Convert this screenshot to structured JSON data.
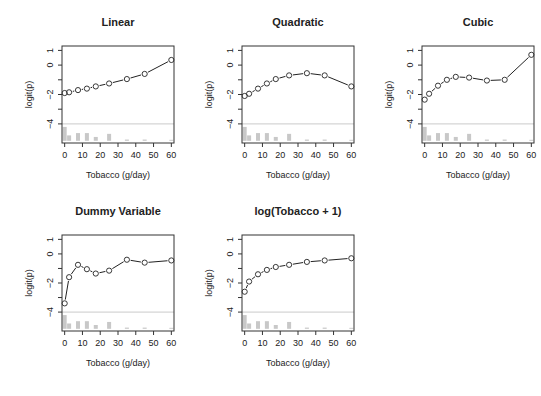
{
  "figure": {
    "panels_layout": "2 rows x 3 columns, last cell empty"
  },
  "chart_data": [
    {
      "type": "line",
      "title": "Linear",
      "xlabel": "Tobacco (g/day)",
      "ylabel": "logit(p)",
      "x": [
        0,
        2.5,
        7.5,
        12.5,
        17.5,
        25,
        35,
        45,
        60
      ],
      "values": [
        -1.9,
        -1.85,
        -1.7,
        -1.6,
        -1.45,
        -1.25,
        -0.95,
        -0.6,
        0.35
      ],
      "xticks": [
        0,
        10,
        20,
        30,
        40,
        50,
        60
      ],
      "yticks": [
        1,
        0,
        -1,
        -2,
        -3,
        -4
      ],
      "ytick_labels": [
        "1",
        "0",
        "",
        "-2",
        "",
        "-4"
      ],
      "xlim": [
        -1.5,
        61.5
      ],
      "ylim": [
        -5.3,
        1.3
      ],
      "reference_line_y": -4,
      "histogram": [
        {
          "x": 0,
          "h": 0.9
        },
        {
          "x": 2.5,
          "h": 0.35
        },
        {
          "x": 7.5,
          "h": 0.5
        },
        {
          "x": 12.5,
          "h": 0.5
        },
        {
          "x": 17.5,
          "h": 0.25
        },
        {
          "x": 25,
          "h": 0.45
        },
        {
          "x": 35,
          "h": 0.08
        },
        {
          "x": 45,
          "h": 0.08
        },
        {
          "x": 60,
          "h": 0.02
        }
      ],
      "grid": false
    },
    {
      "type": "line",
      "title": "Quadratic",
      "xlabel": "Tobacco (g/day)",
      "ylabel": "logit(p)",
      "x": [
        0,
        2.5,
        7.5,
        12.5,
        17.5,
        25,
        35,
        45,
        60
      ],
      "values": [
        -2.1,
        -1.95,
        -1.6,
        -1.25,
        -0.95,
        -0.7,
        -0.55,
        -0.7,
        -1.45
      ],
      "xticks": [
        0,
        10,
        20,
        30,
        40,
        50,
        60
      ],
      "yticks": [
        1,
        0,
        -1,
        -2,
        -3,
        -4
      ],
      "ytick_labels": [
        "1",
        "0",
        "",
        "-2",
        "",
        "-4"
      ],
      "xlim": [
        -1.5,
        61.5
      ],
      "ylim": [
        -5.3,
        1.3
      ],
      "reference_line_y": -4,
      "histogram": [
        {
          "x": 0,
          "h": 0.9
        },
        {
          "x": 2.5,
          "h": 0.35
        },
        {
          "x": 7.5,
          "h": 0.5
        },
        {
          "x": 12.5,
          "h": 0.5
        },
        {
          "x": 17.5,
          "h": 0.25
        },
        {
          "x": 25,
          "h": 0.45
        },
        {
          "x": 35,
          "h": 0.08
        },
        {
          "x": 45,
          "h": 0.08
        },
        {
          "x": 60,
          "h": 0.02
        }
      ],
      "grid": false
    },
    {
      "type": "line",
      "title": "Cubic",
      "xlabel": "Tobacco (g/day)",
      "ylabel": "logit(p)",
      "x": [
        0,
        2.5,
        7.5,
        12.5,
        17.5,
        25,
        35,
        45,
        60
      ],
      "values": [
        -2.35,
        -1.95,
        -1.4,
        -1.0,
        -0.8,
        -0.85,
        -1.05,
        -1.0,
        0.7
      ],
      "xticks": [
        0,
        10,
        20,
        30,
        40,
        50,
        60
      ],
      "yticks": [
        1,
        0,
        -1,
        -2,
        -3,
        -4
      ],
      "ytick_labels": [
        "1",
        "0",
        "",
        "-2",
        "",
        "-4"
      ],
      "xlim": [
        -1.5,
        61.5
      ],
      "ylim": [
        -5.3,
        1.3
      ],
      "reference_line_y": -4,
      "histogram": [
        {
          "x": 0,
          "h": 0.9
        },
        {
          "x": 2.5,
          "h": 0.35
        },
        {
          "x": 7.5,
          "h": 0.5
        },
        {
          "x": 12.5,
          "h": 0.5
        },
        {
          "x": 17.5,
          "h": 0.25
        },
        {
          "x": 25,
          "h": 0.45
        },
        {
          "x": 35,
          "h": 0.08
        },
        {
          "x": 45,
          "h": 0.08
        },
        {
          "x": 60,
          "h": 0.02
        }
      ],
      "grid": false
    },
    {
      "type": "line",
      "title": "Dummy Variable",
      "xlabel": "Tobacco (g/day)",
      "ylabel": "logit(p)",
      "x": [
        0,
        2.5,
        7.5,
        12.5,
        17.5,
        25,
        35,
        45,
        60
      ],
      "values": [
        -3.4,
        -1.6,
        -0.75,
        -1.05,
        -1.35,
        -1.15,
        -0.4,
        -0.6,
        -0.45
      ],
      "xticks": [
        0,
        10,
        20,
        30,
        40,
        50,
        60
      ],
      "yticks": [
        1,
        0,
        -1,
        -2,
        -3,
        -4
      ],
      "ytick_labels": [
        "1",
        "0",
        "",
        "-2",
        "",
        "-4"
      ],
      "xlim": [
        -1.5,
        61.5
      ],
      "ylim": [
        -5.3,
        1.3
      ],
      "reference_line_y": -4,
      "histogram": [
        {
          "x": 0,
          "h": 0.9
        },
        {
          "x": 2.5,
          "h": 0.35
        },
        {
          "x": 7.5,
          "h": 0.5
        },
        {
          "x": 12.5,
          "h": 0.5
        },
        {
          "x": 17.5,
          "h": 0.25
        },
        {
          "x": 25,
          "h": 0.45
        },
        {
          "x": 35,
          "h": 0.08
        },
        {
          "x": 45,
          "h": 0.08
        },
        {
          "x": 60,
          "h": 0.02
        }
      ],
      "grid": false
    },
    {
      "type": "line",
      "title": "log(Tobacco + 1)",
      "xlabel": "Tobacco (g/day)",
      "ylabel": "logit(p)",
      "x": [
        0,
        2.5,
        7.5,
        12.5,
        17.5,
        25,
        35,
        45,
        60
      ],
      "values": [
        -2.6,
        -1.9,
        -1.4,
        -1.1,
        -0.9,
        -0.75,
        -0.55,
        -0.45,
        -0.3
      ],
      "xticks": [
        0,
        10,
        20,
        30,
        40,
        50,
        60
      ],
      "yticks": [
        1,
        0,
        -1,
        -2,
        -3,
        -4
      ],
      "ytick_labels": [
        "1",
        "0",
        "",
        "-2",
        "",
        "-4"
      ],
      "xlim": [
        -1.5,
        61.5
      ],
      "ylim": [
        -5.3,
        1.3
      ],
      "reference_line_y": -4,
      "histogram": [
        {
          "x": 0,
          "h": 0.9
        },
        {
          "x": 2.5,
          "h": 0.35
        },
        {
          "x": 7.5,
          "h": 0.5
        },
        {
          "x": 12.5,
          "h": 0.5
        },
        {
          "x": 17.5,
          "h": 0.25
        },
        {
          "x": 25,
          "h": 0.45
        },
        {
          "x": 35,
          "h": 0.08
        },
        {
          "x": 45,
          "h": 0.08
        },
        {
          "x": 60,
          "h": 0.02
        }
      ],
      "grid": false
    }
  ],
  "colors": {
    "line": "#222222",
    "axis": "#333333",
    "reference_line": "#bdbdbd",
    "histogram": "#c8c8c8"
  }
}
